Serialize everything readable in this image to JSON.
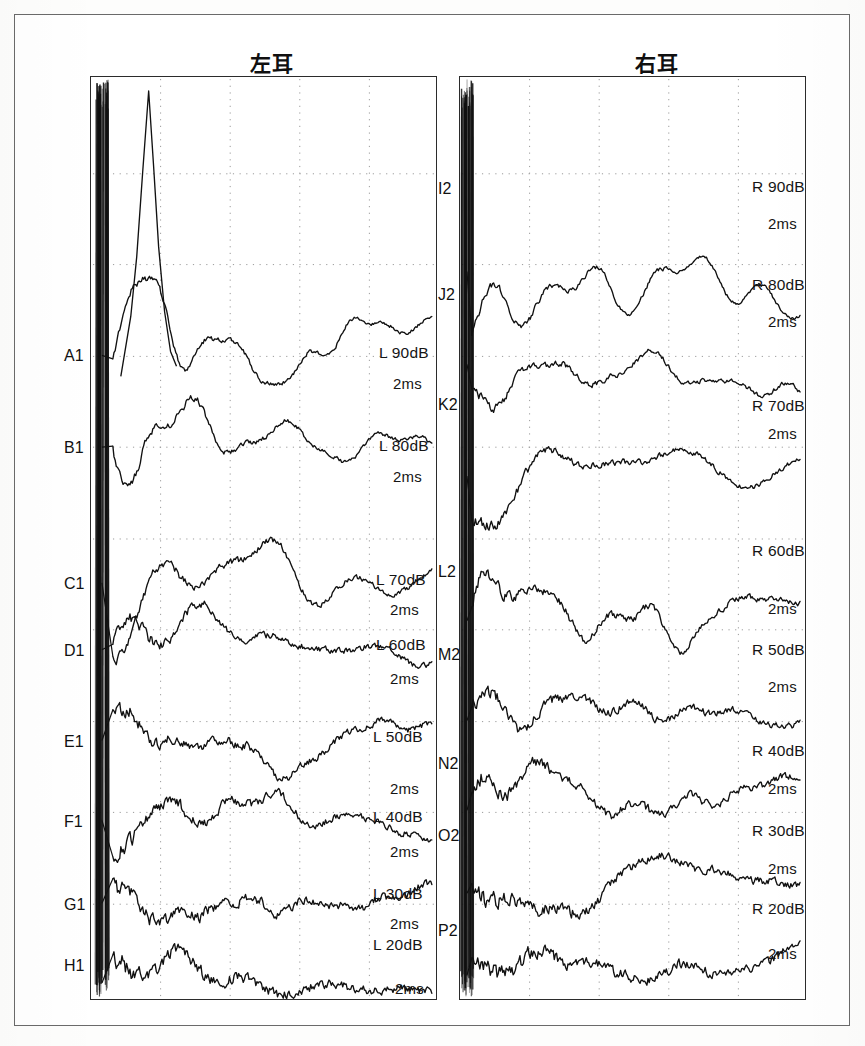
{
  "document": {
    "kind": "abr-waveform-chart",
    "background_color": "#ffffff",
    "frame_color": "#6a6a6a",
    "trace_color": "#111111",
    "grid_color": "#9a9a9a"
  },
  "panels": {
    "left": {
      "title": "左耳",
      "ear": "L",
      "trace_ids": [
        "A1",
        "B1",
        "C1",
        "D1",
        "E1",
        "F1",
        "G1",
        "H1"
      ],
      "level_labels": [
        "L 90dB",
        "L 80dB",
        "L 70dB",
        "L 60dB",
        "L 50dB",
        "L 40dB",
        "L 30dB",
        "L 20dB"
      ],
      "time_labels": [
        "2ms",
        "2ms",
        "2ms",
        "2ms",
        "2ms",
        "2ms",
        "2ms",
        "2ms"
      ]
    },
    "right": {
      "title": "右耳",
      "ear": "R",
      "trace_ids": [
        "I2",
        "J2",
        "K2",
        "L2",
        "M2",
        "N2",
        "O2",
        "P2"
      ],
      "level_labels": [
        "R 90dB",
        "R 80dB",
        "R 70dB",
        "R 60dB",
        "R 50dB",
        "R 40dB",
        "R 30dB",
        "R 20dB"
      ],
      "time_labels": [
        "2ms",
        "2ms",
        "2ms",
        "2ms",
        "2ms",
        "2ms",
        "2ms",
        "2ms"
      ]
    }
  },
  "chart_data": {
    "type": "line",
    "xlabel": "time",
    "ylabel": "amplitude",
    "time_unit": "2ms",
    "grid": true,
    "legend": "none",
    "x_grid_divisions": 5,
    "y_grid_divisions": 10,
    "panels": [
      {
        "name": "左耳",
        "ear": "L",
        "series": [
          {
            "name": "A1",
            "level": "L 90dB",
            "time_marker": "2ms",
            "row": 0
          },
          {
            "name": "B1",
            "level": "L 80dB",
            "time_marker": "2ms",
            "row": 1
          },
          {
            "name": "C1",
            "level": "L 70dB",
            "time_marker": "2ms",
            "row": 2
          },
          {
            "name": "D1",
            "level": "L 60dB",
            "time_marker": "2ms",
            "row": 3
          },
          {
            "name": "E1",
            "level": "L 50dB",
            "time_marker": "2ms",
            "row": 4
          },
          {
            "name": "F1",
            "level": "L 40dB",
            "time_marker": "2ms",
            "row": 5
          },
          {
            "name": "G1",
            "level": "L 30dB",
            "time_marker": "2ms",
            "row": 6
          },
          {
            "name": "H1",
            "level": "L 20dB",
            "time_marker": "2ms",
            "row": 7
          }
        ]
      },
      {
        "name": "右耳",
        "ear": "R",
        "series": [
          {
            "name": "I2",
            "level": "R 90dB",
            "time_marker": "2ms",
            "row": 0
          },
          {
            "name": "J2",
            "level": "R 80dB",
            "time_marker": "2ms",
            "row": 1
          },
          {
            "name": "K2",
            "level": "R 70dB",
            "time_marker": "2ms",
            "row": 2
          },
          {
            "name": "L2",
            "level": "R 60dB",
            "time_marker": "2ms",
            "row": 3
          },
          {
            "name": "M2",
            "level": "R 50dB",
            "time_marker": "2ms",
            "row": 4
          },
          {
            "name": "N2",
            "level": "R 40dB",
            "time_marker": "2ms",
            "row": 5
          },
          {
            "name": "O2",
            "level": "R 30dB",
            "time_marker": "2ms",
            "row": 6
          },
          {
            "name": "P2",
            "level": "R 20dB",
            "time_marker": "2ms",
            "row": 7
          }
        ]
      }
    ]
  }
}
